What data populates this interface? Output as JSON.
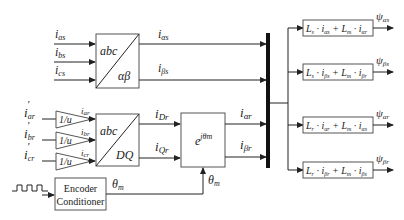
{
  "diagram": {
    "type": "signal-flow block diagram",
    "inputs": {
      "stator": [
        {
          "main": "i",
          "sub": "as"
        },
        {
          "main": "i",
          "sub": "bs"
        },
        {
          "main": "i",
          "sub": "cs"
        }
      ],
      "rotor": [
        {
          "main": "i",
          "sub": "ar",
          "prime": "'"
        },
        {
          "main": "i",
          "sub": "br",
          "prime": "'"
        },
        {
          "main": "i",
          "sub": "cr",
          "prime": "'"
        }
      ]
    },
    "blocks": {
      "clarke": {
        "top": "abc",
        "bottom": "αβ"
      },
      "park": {
        "top": "abc",
        "bottom": "DQ"
      },
      "gains": [
        {
          "label": "1/u",
          "out": {
            "main": "i",
            "sub": "ar"
          }
        },
        {
          "label": "1/u",
          "out": {
            "main": "i",
            "sub": "br"
          }
        },
        {
          "label": "1/u",
          "out": {
            "main": "i",
            "sub": "cr"
          }
        }
      ],
      "rotation": {
        "base": "e",
        "exp": "jθm"
      },
      "encoder": {
        "line1": "Encoder",
        "line2": "Conditioner"
      }
    },
    "signals": {
      "i_alpha_s": {
        "main": "i",
        "sub": "αs"
      },
      "i_beta_s": {
        "main": "i",
        "sub": "βs"
      },
      "i_Dr": {
        "main": "i",
        "sub": "Dr"
      },
      "i_Qr": {
        "main": "i",
        "sub": "Qr"
      },
      "i_alpha_r": {
        "main": "i",
        "sub": "αr"
      },
      "i_beta_r": {
        "main": "i",
        "sub": "βr"
      },
      "theta_encoder": {
        "main": "θ",
        "sub": "m"
      },
      "theta_rot": {
        "main": "θ",
        "sub": "m"
      }
    },
    "equations": [
      {
        "t1": "L",
        "s1": "s",
        "t2": "i",
        "s2": "αs",
        "t3": "L",
        "s3": "m",
        "t4": "i",
        "s4": "αr",
        "out_main": "ψ",
        "out_sub": "αs"
      },
      {
        "t1": "L",
        "s1": "s",
        "t2": "i",
        "s2": "βs",
        "t3": "L",
        "s3": "m",
        "t4": "i",
        "s4": "βr",
        "out_main": "ψ",
        "out_sub": "βs"
      },
      {
        "t1": "L",
        "s1": "r",
        "t2": "i",
        "s2": "αr",
        "t3": "L",
        "s3": "m",
        "t4": "i",
        "s4": "αs",
        "out_main": "ψ",
        "out_sub": "αr"
      },
      {
        "t1": "L",
        "s1": "r",
        "t2": "i",
        "s2": "βr",
        "t3": "L",
        "s3": "m",
        "t4": "i",
        "s4": "βs",
        "out_main": "ψ",
        "out_sub": "βr"
      }
    ],
    "colors": {
      "line": "#222222",
      "box": "#555555",
      "bus": "#111111"
    }
  }
}
